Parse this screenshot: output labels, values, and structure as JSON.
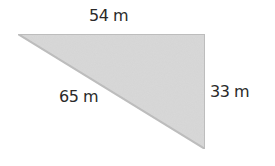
{
  "diagram": {
    "shape": "right-triangle",
    "fill_color": "#d8d8d8",
    "stroke_color": "#b8b8b8",
    "sides": {
      "top": {
        "label": "54 m",
        "value": 54,
        "unit": "m"
      },
      "hypotenuse": {
        "label": "65 m",
        "value": 65,
        "unit": "m"
      },
      "right": {
        "label": "33 m",
        "value": 33,
        "unit": "m"
      }
    }
  }
}
